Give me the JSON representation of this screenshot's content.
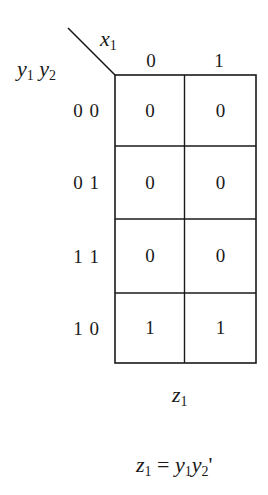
{
  "kmap": {
    "col_var": "x",
    "col_var_sub": "1",
    "row_var_1": "y",
    "row_var_1_sub": "1",
    "row_var_2": "y",
    "row_var_2_sub": "2",
    "col_labels": [
      "0",
      "1"
    ],
    "row_labels": [
      "0 0",
      "0 1",
      "1 1",
      "1 0"
    ],
    "cells": [
      [
        "0",
        "0"
      ],
      [
        "0",
        "0"
      ],
      [
        "0",
        "0"
      ],
      [
        "1",
        "1"
      ]
    ],
    "output_name": "z",
    "output_sub": "1"
  },
  "equation": {
    "lhs": "z",
    "lhs_sub": "1",
    "equals": " = ",
    "t1": "y",
    "t1_sub": "1",
    "t2": "y",
    "t2_sub": "2",
    "prime": "'"
  }
}
